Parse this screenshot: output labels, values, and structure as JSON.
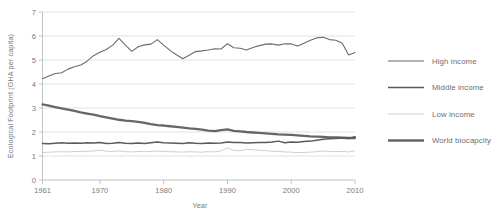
{
  "chart_data": {
    "type": "line",
    "title": "",
    "xlabel": "Year",
    "ylabel": "Ecological Footprint (GHA per capita)",
    "xlim": [
      1961,
      2010
    ],
    "ylim": [
      0,
      7
    ],
    "ytick_labels": [
      "0",
      "1",
      "2",
      "3",
      "4",
      "5",
      "6",
      "7"
    ],
    "yticks": [
      0,
      1,
      2,
      3,
      4,
      5,
      6,
      7
    ],
    "xtick_labels": [
      "1961",
      "1970",
      "1980",
      "1990",
      "2000",
      "2010"
    ],
    "xticks": [
      1961,
      1970,
      1980,
      1990,
      2000,
      2010
    ],
    "grid": "horizontal",
    "legend_position": "right",
    "x": [
      1961,
      1962,
      1963,
      1964,
      1965,
      1966,
      1967,
      1968,
      1969,
      1970,
      1971,
      1972,
      1973,
      1974,
      1975,
      1976,
      1977,
      1978,
      1979,
      1980,
      1981,
      1982,
      1983,
      1984,
      1985,
      1986,
      1987,
      1988,
      1989,
      1990,
      1991,
      1992,
      1993,
      1994,
      1995,
      1996,
      1997,
      1998,
      1999,
      2000,
      2001,
      2002,
      2003,
      2004,
      2005,
      2006,
      2007,
      2008,
      2009,
      2010
    ],
    "series": [
      {
        "name": "High income",
        "color": "#6b6b6b",
        "width": 1.1,
        "values": [
          4.22,
          4.33,
          4.44,
          4.47,
          4.62,
          4.72,
          4.79,
          4.95,
          5.18,
          5.32,
          5.44,
          5.62,
          5.9,
          5.62,
          5.36,
          5.55,
          5.63,
          5.66,
          5.85,
          5.62,
          5.4,
          5.22,
          5.05,
          5.2,
          5.35,
          5.38,
          5.42,
          5.47,
          5.46,
          5.68,
          5.51,
          5.49,
          5.42,
          5.52,
          5.6,
          5.66,
          5.67,
          5.62,
          5.68,
          5.67,
          5.58,
          5.7,
          5.82,
          5.92,
          5.95,
          5.85,
          5.82,
          5.7,
          5.21,
          5.31
        ]
      },
      {
        "name": "Middle income",
        "color": "#5a5a5a",
        "width": 1.5,
        "values": [
          1.52,
          1.51,
          1.53,
          1.55,
          1.53,
          1.54,
          1.53,
          1.55,
          1.54,
          1.56,
          1.52,
          1.53,
          1.56,
          1.53,
          1.52,
          1.54,
          1.52,
          1.55,
          1.58,
          1.55,
          1.54,
          1.53,
          1.52,
          1.55,
          1.53,
          1.52,
          1.54,
          1.53,
          1.54,
          1.58,
          1.56,
          1.56,
          1.54,
          1.55,
          1.56,
          1.56,
          1.58,
          1.62,
          1.55,
          1.58,
          1.57,
          1.6,
          1.62,
          1.66,
          1.7,
          1.72,
          1.73,
          1.75,
          1.73,
          1.8
        ]
      },
      {
        "name": "Low income",
        "color": "#c3c3c3",
        "width": 0.8,
        "values": [
          1.14,
          1.16,
          1.17,
          1.18,
          1.17,
          1.19,
          1.18,
          1.2,
          1.21,
          1.24,
          1.2,
          1.19,
          1.21,
          1.18,
          1.17,
          1.19,
          1.18,
          1.19,
          1.21,
          1.19,
          1.18,
          1.17,
          1.16,
          1.18,
          1.17,
          1.16,
          1.18,
          1.17,
          1.22,
          1.34,
          1.23,
          1.22,
          1.28,
          1.26,
          1.24,
          1.22,
          1.2,
          1.19,
          1.17,
          1.16,
          1.14,
          1.15,
          1.16,
          1.18,
          1.21,
          1.19,
          1.18,
          1.19,
          1.17,
          1.21
        ]
      },
      {
        "name": "World biocapcity",
        "color": "#666666",
        "width": 2.3,
        "values": [
          3.15,
          3.1,
          3.04,
          2.98,
          2.93,
          2.88,
          2.82,
          2.77,
          2.72,
          2.66,
          2.61,
          2.56,
          2.51,
          2.47,
          2.45,
          2.42,
          2.38,
          2.33,
          2.29,
          2.27,
          2.24,
          2.21,
          2.18,
          2.15,
          2.13,
          2.1,
          2.06,
          2.04,
          2.08,
          2.11,
          2.05,
          2.03,
          2.0,
          1.98,
          1.96,
          1.94,
          1.92,
          1.9,
          1.89,
          1.88,
          1.86,
          1.84,
          1.82,
          1.81,
          1.8,
          1.78,
          1.77,
          1.76,
          1.75,
          1.75
        ]
      }
    ]
  },
  "legend": {
    "items": [
      {
        "label": "High income"
      },
      {
        "label": "Middle income"
      },
      {
        "label": "Low income"
      },
      {
        "label": "World biocapcity"
      }
    ]
  }
}
